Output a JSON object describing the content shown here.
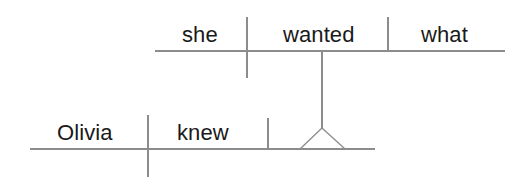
{
  "diagram": {
    "type": "reed-kellogg-sentence-diagram",
    "sentence": "Olivia knew what she wanted.",
    "stroke_color": "#8c8c8c",
    "text_color": "#1a1a1a",
    "background_color": "#ffffff",
    "main_clause": {
      "name": "main-clause",
      "subject": "Olivia",
      "verb": "knew",
      "baseline": {
        "x1": 30,
        "y1": 149,
        "x2": 375,
        "y2": 149
      },
      "subject_verb_divider": {
        "x": 148,
        "y1": 115,
        "y2": 177
      },
      "verb_object_divider": {
        "x": 268,
        "y1": 118,
        "y2": 149
      }
    },
    "subordinate_clause": {
      "name": "subordinate-clause",
      "subject": "she",
      "verb": "wanted",
      "object": "what",
      "baseline": {
        "x1": 155,
        "y1": 51,
        "x2": 505,
        "y2": 51
      },
      "subject_verb_divider": {
        "x": 247,
        "y1": 17,
        "y2": 78
      },
      "verb_object_divider": {
        "x": 388,
        "y1": 17,
        "y2": 51
      }
    },
    "connector": {
      "name": "clause-connector-stem",
      "stem": {
        "x": 322,
        "y1": 51,
        "y2": 128
      },
      "tripod": {
        "apex_x": 322,
        "apex_y": 128,
        "left_x": 300,
        "right_x": 345,
        "base_y": 149
      }
    }
  }
}
